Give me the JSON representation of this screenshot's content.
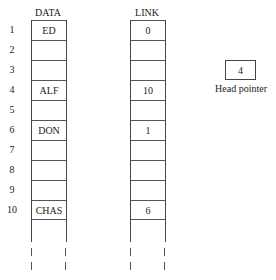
{
  "headers": {
    "data": "DATA",
    "link": "LINK"
  },
  "rows": [
    {
      "index": "1",
      "data": "ED",
      "link": "0"
    },
    {
      "index": "2",
      "data": "",
      "link": ""
    },
    {
      "index": "3",
      "data": "",
      "link": ""
    },
    {
      "index": "4",
      "data": "ALF",
      "link": "10"
    },
    {
      "index": "5",
      "data": "",
      "link": ""
    },
    {
      "index": "6",
      "data": "DON",
      "link": "1"
    },
    {
      "index": "7",
      "data": "",
      "link": ""
    },
    {
      "index": "8",
      "data": "",
      "link": ""
    },
    {
      "index": "9",
      "data": "",
      "link": ""
    },
    {
      "index": "10",
      "data": "CHAS",
      "link": "6"
    }
  ],
  "head_pointer": {
    "value": "4",
    "label": "Head pointer"
  }
}
